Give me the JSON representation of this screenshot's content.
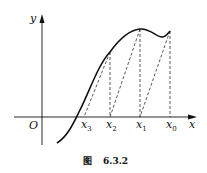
{
  "figure": {
    "caption_prefix": "图",
    "caption_number": "6.3.2"
  },
  "axes": {
    "x_label": "x",
    "y_label": "y",
    "origin_label": "O"
  },
  "points": [
    {
      "name": "x",
      "sub": "3"
    },
    {
      "name": "x",
      "sub": "2"
    },
    {
      "name": "x",
      "sub": "1"
    },
    {
      "name": "x",
      "sub": "0"
    }
  ],
  "colors": {
    "ink": "#111111",
    "background": "#ffffff"
  }
}
